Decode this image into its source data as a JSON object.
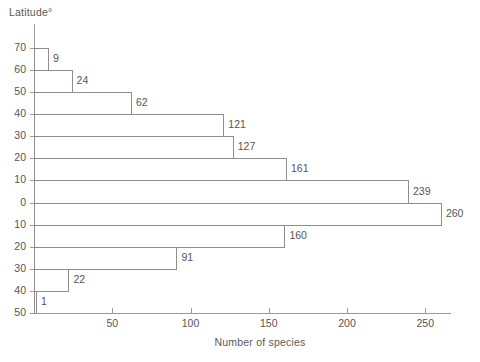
{
  "chart_data": {
    "type": "bar",
    "orientation": "horizontal",
    "title": "",
    "ylabel": "Latitude°",
    "xlabel": "Number of species",
    "xlim": [
      0,
      266
    ],
    "xticks": [
      50,
      100,
      150,
      200,
      250
    ],
    "xtick_labels": [
      "50",
      "100",
      "150",
      "200",
      "250"
    ],
    "ytick_labels": [
      "70",
      "60",
      "50",
      "40",
      "30",
      "20",
      "10",
      "0",
      "10",
      "20",
      "30",
      "40",
      "50"
    ],
    "grid": false,
    "legend": "none",
    "categories": [
      "70–60 N",
      "60–50 N",
      "50–40 N",
      "40–30 N",
      "30–20 N",
      "20–10 N",
      "10–0 N",
      "0–10 S",
      "10–20 S",
      "20–30 S",
      "30–40 S",
      "40–50 S"
    ],
    "values": [
      9,
      24,
      62,
      121,
      127,
      161,
      239,
      260,
      160,
      91,
      22,
      1
    ],
    "bar_labels": [
      "9",
      "24",
      "62",
      "121",
      "127",
      "161",
      "239",
      "260",
      "160",
      "91",
      "22",
      "1"
    ]
  },
  "colors": {
    "axis": "#9a9a9a",
    "bar_outline": "#8e8e8e",
    "text": "#555555",
    "background": "#ffffff"
  }
}
